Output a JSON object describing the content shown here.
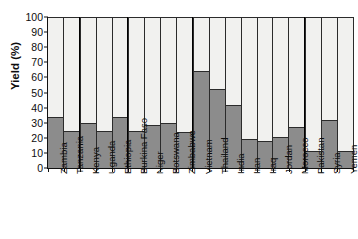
{
  "chart_data": {
    "type": "bar",
    "subtype": "stacked-100-percent",
    "title": "",
    "subtitle": "",
    "xlabel": "",
    "ylabel": "Yield (%)",
    "ylim": [
      0,
      100
    ],
    "ytick_step": 10,
    "ytick_labels": [
      "100",
      "90",
      "80",
      "70",
      "60",
      "50",
      "40",
      "30",
      "20",
      "10",
      "0"
    ],
    "grid": false,
    "legend": "none",
    "legend_entries": [],
    "categories": [
      "Zambia",
      "Tanzania",
      "Kenya",
      "Uganda",
      "Ethiopia",
      "Burkina Faso",
      "Niger",
      "Botswana",
      "Zimbabwe",
      "Vietnam",
      "Thailand",
      "India",
      "Iran",
      "Iraq",
      "Jordan",
      "Morocco",
      "Pakistan",
      "Syria",
      "Yemen"
    ],
    "series": [
      {
        "name": "Yield",
        "color": "#8c8c8c",
        "values": [
          33.5,
          24.5,
          30,
          24.5,
          33.5,
          24.5,
          28.5,
          29.5,
          24,
          64,
          52,
          41.5,
          19.5,
          18,
          20.5,
          27,
          11.5,
          32,
          11.5
        ]
      },
      {
        "name": "Remainder",
        "color": "#f1f1ef",
        "values": [
          66.5,
          75.5,
          70,
          75.5,
          66.5,
          75.5,
          71.5,
          70.5,
          76,
          36,
          48,
          58.5,
          80.5,
          82,
          79.5,
          73,
          88.5,
          68,
          88.5
        ]
      }
    ],
    "group_separators_after": [
      "Tanzania",
      "Ethiopia",
      "Zimbabwe",
      "Morocco"
    ],
    "colors": {
      "yield_fill": "#8c8c8c",
      "remainder_fill": "#f1f1ef",
      "bar_outline": "#2b2b2b",
      "axis": "#111111",
      "text": "#0d0d0d",
      "background": "#ffffff"
    }
  }
}
